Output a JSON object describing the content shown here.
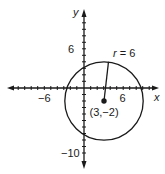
{
  "diagram": {
    "type": "coordinate-plane-circle",
    "axes": {
      "x_label": "x",
      "y_label": "y",
      "x_tick_labels": [
        {
          "value": -6,
          "text": "−6"
        },
        {
          "value": 6,
          "text": "6"
        }
      ],
      "y_tick_labels": [
        {
          "value": 6,
          "text": "6"
        },
        {
          "value": -10,
          "text": "−10"
        }
      ]
    },
    "circle": {
      "center_label": "(3,−2)",
      "center": [
        3,
        -2
      ],
      "radius": 6,
      "radius_label": "r = 6"
    },
    "colors": {
      "stroke": "#1a1a1a",
      "background": "#ffffff"
    }
  }
}
